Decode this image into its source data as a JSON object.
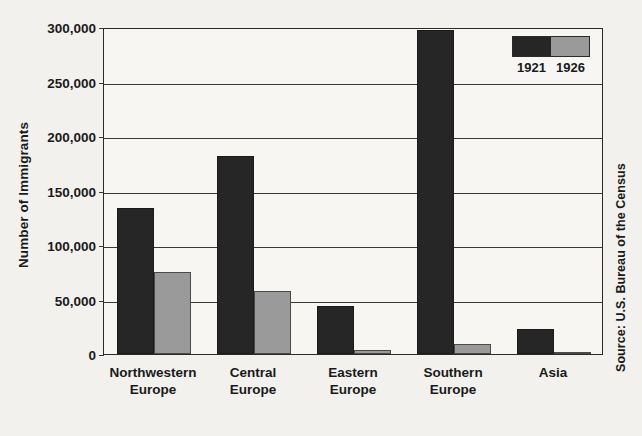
{
  "chart_data": {
    "type": "bar",
    "title": "",
    "subtitle": "",
    "xlabel": "",
    "ylabel": "Number of Immigrants",
    "categories": [
      "Northwestern Europe",
      "Central Europe",
      "Eastern Europe",
      "Southern Europe",
      "Asia"
    ],
    "category_lines": [
      [
        "Northwestern",
        "Europe"
      ],
      [
        "Central",
        "Europe"
      ],
      [
        "Eastern",
        "Europe"
      ],
      [
        "Southern",
        "Europe"
      ],
      [
        "Asia",
        ""
      ]
    ],
    "series": [
      {
        "name": "1921",
        "color": "#262626",
        "values": [
          134000,
          182000,
          44000,
          297000,
          23000
        ]
      },
      {
        "name": "1926",
        "color": "#9a9a9a",
        "values": [
          75000,
          58000,
          4000,
          9000,
          2000
        ]
      }
    ],
    "ylim": [
      0,
      300000
    ],
    "yticks": [
      0,
      50000,
      100000,
      150000,
      200000,
      250000,
      300000
    ],
    "ytick_labels": [
      "0",
      "50,000",
      "100,000",
      "150,000",
      "200,000",
      "250,000",
      "300,000"
    ],
    "grid": true,
    "legend_position": "top-right",
    "source": "Source: U.S. Bureau of the Census"
  },
  "legend": {
    "entries": [
      {
        "label": "1921",
        "color": "#262626"
      },
      {
        "label": "1926",
        "color": "#9a9a9a"
      }
    ]
  },
  "axis": {
    "y_title": "Number of Immigrants"
  },
  "footnote": {
    "source": "Source: U.S. Bureau of the Census"
  }
}
